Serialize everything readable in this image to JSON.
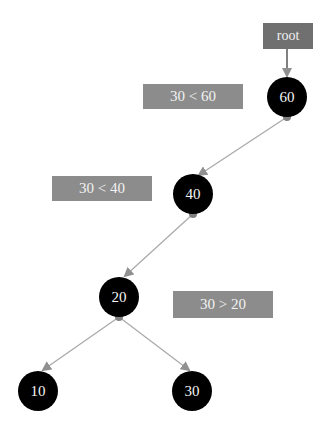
{
  "diagram": {
    "root_label": "root",
    "nodes": [
      {
        "id": "n60",
        "value": "60"
      },
      {
        "id": "n40",
        "value": "40"
      },
      {
        "id": "n20",
        "value": "20"
      },
      {
        "id": "n10",
        "value": "10"
      },
      {
        "id": "n30",
        "value": "30"
      }
    ],
    "comparisons": [
      {
        "text": "30 < 60"
      },
      {
        "text": "30 < 40"
      },
      {
        "text": "30 > 20"
      }
    ],
    "colors": {
      "node_fill": "#000000",
      "edge": "#a0a0a0",
      "label_box": "#8c8c8c",
      "root_box": "#707070"
    }
  }
}
